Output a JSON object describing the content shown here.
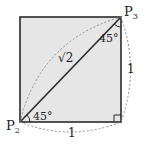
{
  "diagram": {
    "type": "geometry",
    "colors": {
      "fill": "#e6e6e6",
      "stroke": "#2a2a2a",
      "dashed": "#8a8a8a"
    },
    "points": {
      "p2": {
        "label": "P",
        "sub": "2"
      },
      "p3": {
        "label": "P",
        "sub": "3"
      }
    },
    "labels": {
      "diagonal": "√2",
      "side_bottom": "1",
      "side_right": "1",
      "angle_bottom_left": "45°",
      "angle_top_right": "45°"
    }
  }
}
